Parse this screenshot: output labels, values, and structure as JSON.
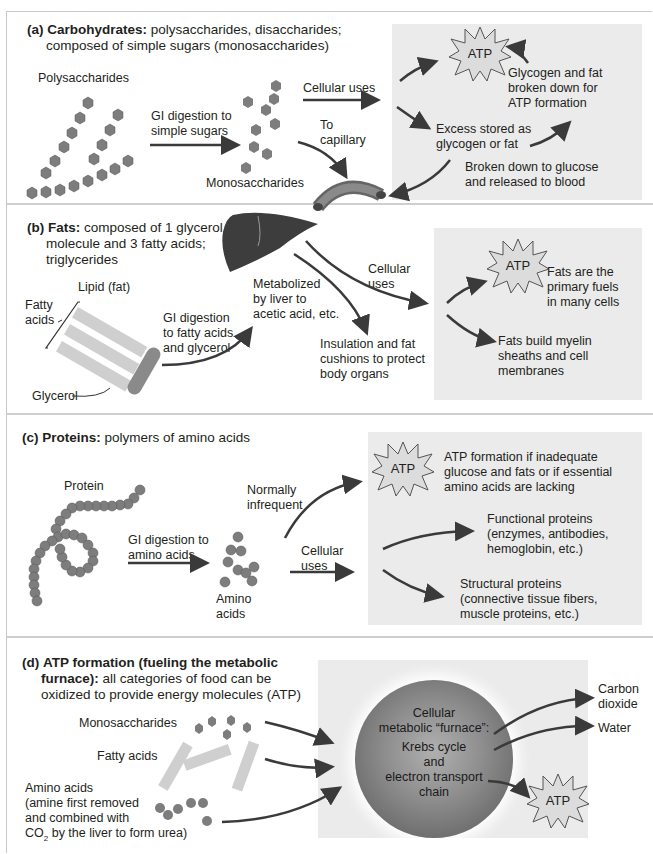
{
  "panels": {
    "a": {
      "label": "(a)",
      "title_bold": "Carbohydrates:",
      "title_rest": " polysaccharides, disaccharides;",
      "title_line2": "composed of simple sugars (monosaccharides)",
      "polysaccharides": "Polysaccharides",
      "gi_line1": "GI digestion to",
      "gi_line2": "simple sugars",
      "monosaccharides": "Monosaccharides",
      "cellular_uses": "Cellular uses",
      "to_capillary_1": "To",
      "to_capillary_2": "capillary",
      "atp": "ATP",
      "glycogen_1": "Glycogen and fat",
      "glycogen_2": "broken down for",
      "glycogen_3": "ATP formation",
      "excess_1": "Excess stored as",
      "excess_2": "glycogen or fat",
      "broken_1": "Broken down to glucose",
      "broken_2": "and released to blood"
    },
    "b": {
      "label": "(b)",
      "title_bold": "Fats:",
      "title_rest": " composed of 1 glycerol",
      "title_line2": "molecule and 3 fatty acids;",
      "title_line3": "triglycerides",
      "lipid": "Lipid (fat)",
      "fatty_1": "Fatty",
      "fatty_2": "acids",
      "glycerol": "Glycerol",
      "gi_1": "GI digestion",
      "gi_2": "to fatty acids",
      "gi_3": "and glycerol",
      "metab_1": "Metabolized",
      "metab_2": "by liver to",
      "metab_3": "acetic acid, etc.",
      "cellular_1": "Cellular",
      "cellular_2": "uses",
      "insul_1": "Insulation and fat",
      "insul_2": "cushions to protect",
      "insul_3": "body organs",
      "atp": "ATP",
      "fuel_1": "Fats are the",
      "fuel_2": "primary fuels",
      "fuel_3": "in many cells",
      "myelin_1": "Fats build myelin",
      "myelin_2": "sheaths and cell",
      "myelin_3": "membranes"
    },
    "c": {
      "label": "(c)",
      "title_bold": "Proteins:",
      "title_rest": " polymers of amino acids",
      "protein": "Protein",
      "gi_1": "GI digestion to",
      "gi_2": "amino acids",
      "amino_1": "Amino",
      "amino_2": "acids",
      "normally_1": "Normally",
      "normally_2": "infrequent",
      "cellular_1": "Cellular",
      "cellular_2": "uses",
      "atp": "ATP",
      "atpform_1": "ATP formation if inadequate",
      "atpform_2": "glucose and fats or if essential",
      "atpform_3": "amino acids are lacking",
      "func_1": "Functional proteins",
      "func_2": "(enzymes, antibodies,",
      "func_3": "hemoglobin, etc.)",
      "struct_1": "Structural proteins",
      "struct_2": "(connective tissue fibers,",
      "struct_3": "muscle proteins, etc.)"
    },
    "d": {
      "label": "(d)",
      "title_bold_1": "ATP formation (fueling the metabolic",
      "title_bold_2": "furnace):",
      "title_rest": " all categories of food can be",
      "title_line3": "oxidized to provide energy molecules (ATP)",
      "mono": "Monosaccharides",
      "fatty": "Fatty acids",
      "amino_1": "Amino acids",
      "amino_2": "(amine first removed",
      "amino_3": "and combined with",
      "amino_4a": "CO",
      "amino_4sub": "2",
      "amino_4b": " by the liver to form urea)",
      "furnace_1": "Cellular",
      "furnace_2": "metabolic “furnace”:",
      "furnace_3": "Krebs cycle",
      "furnace_4": "and",
      "furnace_5": "electron transport",
      "furnace_6": "chain",
      "co2_1": "Carbon",
      "co2_2": "dioxide",
      "water": "Water",
      "atp": "ATP"
    }
  },
  "colors": {
    "shade": "#ebebeb",
    "arrow": "#3a3a3a",
    "molecule": "#7d7d7d",
    "fatty_bar": "#cfcfcf",
    "glycerol": "#8a8a8a",
    "atp_fill": "#dcdcdc"
  }
}
